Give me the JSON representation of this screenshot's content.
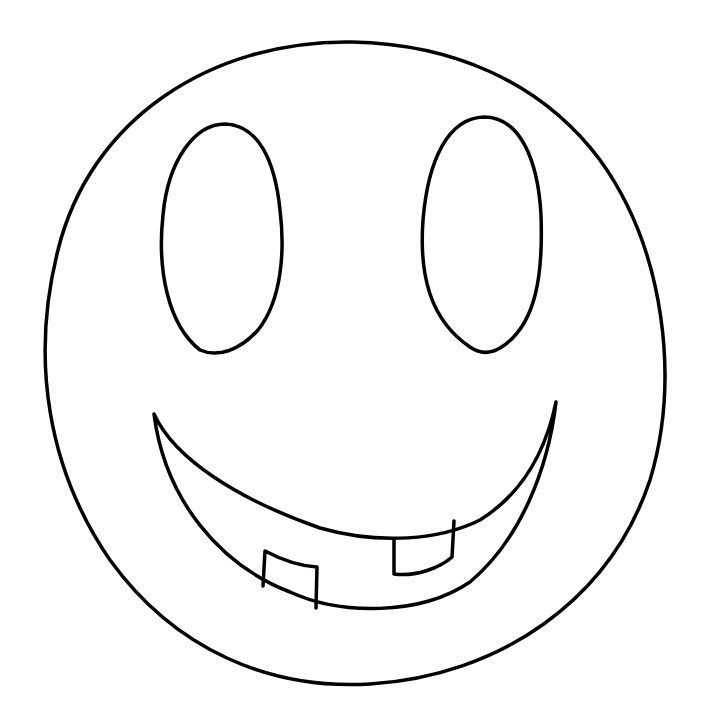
{
  "drawing": {
    "subject": "smiley face",
    "style": "hand-drawn black line art on white",
    "colors": {
      "background": "#ffffff",
      "line": "#000000"
    },
    "parts": {
      "face": "round head outline",
      "left_eye": "tall oval",
      "right_eye": "tall oval",
      "mouth": "crescent smile",
      "teeth": [
        "lower left tooth",
        "upper right tooth"
      ]
    }
  }
}
